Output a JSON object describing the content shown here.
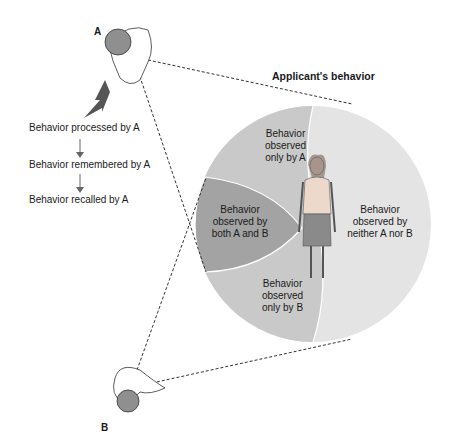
{
  "title": "Applicant's behavior",
  "persons": {
    "a": "A",
    "b": "B"
  },
  "process_chain": [
    "Behavior processed by A",
    "Behavior remembered by A",
    "Behavior recalled by A"
  ],
  "regions": {
    "only_a": [
      "Behavior",
      "observed",
      "only by A"
    ],
    "both": [
      "Behavior",
      "observed by",
      "both A and B"
    ],
    "only_b": [
      "Behavior",
      "observed",
      "only by B"
    ],
    "neither": [
      "Behavior",
      "observed by",
      "neither A nor B"
    ]
  },
  "colors": {
    "neither": "#e4e4e4",
    "only": "#c9c9c9",
    "both": "#a3a3a3",
    "head": "#8f8f8f"
  }
}
